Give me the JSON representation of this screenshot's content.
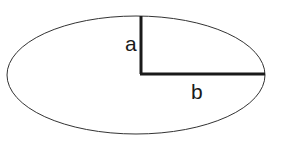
{
  "diagram": {
    "labels": {
      "semi_minor": "a",
      "semi_major": "b"
    },
    "colors": {
      "stroke": "#1a1a1a",
      "background": "#ffffff"
    }
  }
}
